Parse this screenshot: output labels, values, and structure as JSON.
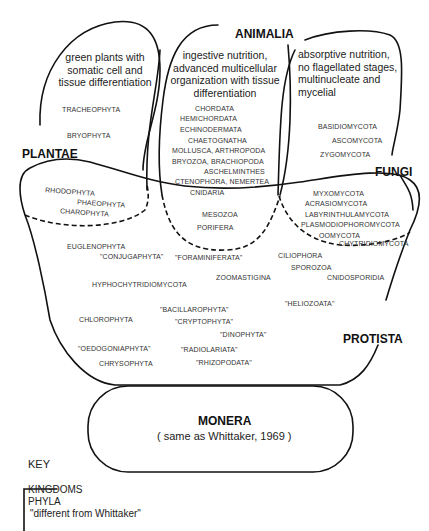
{
  "kingdoms": {
    "plantae": {
      "name": "PLANTAE",
      "description": "green plants with somatic cell and tissue differentiation",
      "phyla": [
        "TRACHEOPHYTA",
        "BRYOPHYTA"
      ]
    },
    "animalia": {
      "name": "ANIMALIA",
      "description": "ingestive nutrition, advanced multicellular organization with tissue differentiation",
      "phyla": [
        "CHORDATA",
        "HEMICHORDATA",
        "ECHINODERMATA",
        "CHAETOGNATHA",
        "MOLLUSCA, ARTHROPODA",
        "BRYOZOA, BRACHIOPODA",
        "ASCHELMINTHES",
        "CTENOPHORA, NEMERTEA",
        "CNIDARIA"
      ]
    },
    "fungi": {
      "name": "FUNGI",
      "description": "absorptive nutrition, no flagellated stages, multinucleate and mycelial",
      "phyla": [
        "BASIDIOMYCOTA",
        "ASCOMYCOTA",
        "ZYGOMYCOTA"
      ]
    },
    "protista": {
      "name": "PROTISTA",
      "plant_overlap_phyla": [
        "RHODOPHYTA",
        "PHAEOPHYTA",
        "CHAROPHYTA"
      ],
      "animal_overlap_phyla": [
        "MESOZOA",
        "PORIFERA"
      ],
      "fungi_overlap_phyla": [
        "MYXOMYCOTA",
        "ACRASIOMYCOTA",
        "LABYRINTHULAMYCOTA",
        "PLASMODIOPHOROMYCOTA",
        "OOMYCOTA",
        "CHYTRIDIOMYCOTA"
      ],
      "phyla": [
        "EUGLENOPHYTA",
        "\"CONJUGAPHYTA\"",
        "\"FORAMINIFERATA\"",
        "CILIOPHORA",
        "SPOROZOA",
        "CNIDOSPORIDIA",
        "HYPHOCHYTRIDIOMYCOTA",
        "ZOOMASTIGINA",
        "\"HELIOZOATA\"",
        "\"BACILLAROPHYTA\"",
        "\"CRYPTOPHYTA\"",
        "CHLOROPHYTA",
        "\"DINOPHYTA\"",
        "\"OEDOGONIAPHYTA\"",
        "\"RADIOLARIATA\"",
        "CHRYSOPHYTA",
        "\"RHIZOPODATA\""
      ]
    },
    "monera": {
      "name": "MONERA",
      "note": "( same as Whittaker, 1969 )"
    }
  },
  "key": {
    "title": "KEY",
    "items": [
      "KINGDOMS",
      "PHYLA",
      "\"different from Whittaker\""
    ]
  }
}
